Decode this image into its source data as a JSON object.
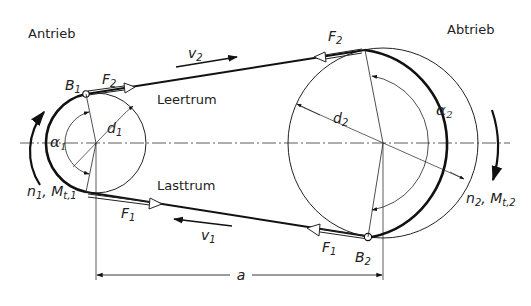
{
  "labels": {
    "drive": "Antrieb",
    "driven": "Abtrieb",
    "slack_side": "Leertrum",
    "tight_side": "Lasttrum",
    "center_distance": "a",
    "point_b1": {
      "main": "B",
      "sub": "1"
    },
    "point_b2": {
      "main": "B",
      "sub": "2"
    },
    "force_f2_left": {
      "main": "F",
      "sub": "2"
    },
    "force_f2_right": {
      "main": "F",
      "sub": "2"
    },
    "force_f1_left": {
      "main": "F",
      "sub": "1"
    },
    "force_f1_right": {
      "main": "F",
      "sub": "1"
    },
    "velocity_v2": {
      "main": "v",
      "sub": "2"
    },
    "velocity_v1": {
      "main": "v",
      "sub": "1"
    },
    "diameter_d1": {
      "main": "d",
      "sub": "1"
    },
    "diameter_d2": {
      "main": "d",
      "sub": "2"
    },
    "angle_alpha1": {
      "main": "α",
      "sub": "1"
    },
    "angle_alpha2": {
      "main": "α",
      "sub": "2"
    },
    "speed_torque_1": {
      "main": "n",
      "sub1": "1",
      "sep": ", M",
      "sub2": "t,1"
    },
    "speed_torque_2": {
      "main": "n",
      "sub1": "2",
      "sep": ", M",
      "sub2": "t,2"
    }
  },
  "geometry": {
    "small_pulley": {
      "cx": 96,
      "cy": 143,
      "r": 50
    },
    "large_pulley": {
      "cx": 383,
      "cy": 143,
      "r": 95
    }
  }
}
